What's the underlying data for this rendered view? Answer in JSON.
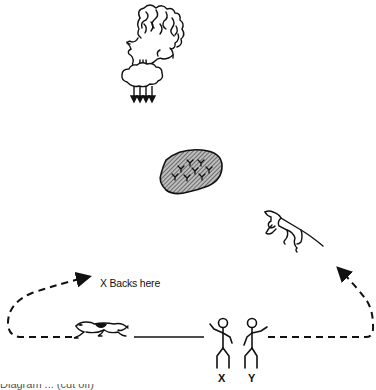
{
  "diagram": {
    "path_label": "X Backs here",
    "persons": [
      {
        "id": "X",
        "label": "X"
      },
      {
        "id": "Y",
        "label": "Y"
      }
    ],
    "elements": [
      {
        "name": "wind-face",
        "description": "Face with curly hair blowing wind downward (arrows pointing down)"
      },
      {
        "name": "flock",
        "description": "Shaded oval representing a flock / group of sheep"
      },
      {
        "name": "right-dog",
        "description": "Dog leaping up on the right, arrow pointing toward it"
      },
      {
        "name": "left-dog",
        "description": "Dog running on the left along path"
      },
      {
        "name": "persons",
        "description": "Two stick figures labelled X and Y"
      }
    ],
    "caption_partial": "Diagram ... (cut off)",
    "colors": {
      "line": "#111111",
      "background": "#ffffff",
      "fill_hatch": "#555555"
    }
  }
}
